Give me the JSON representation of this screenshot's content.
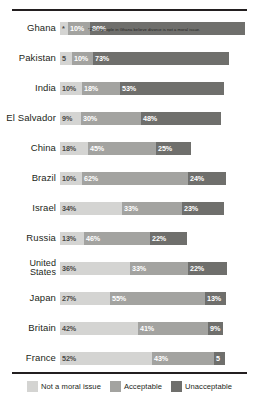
{
  "chart_data": {
    "type": "bar",
    "subtype": "stacked-horizontal",
    "title": "",
    "xlabel": "",
    "ylabel": "",
    "grid": false,
    "legend_position": "bottom",
    "categories": [
      "Ghana",
      "Pakistan",
      "India",
      "El Salvador",
      "China",
      "Brazil",
      "Israel",
      "Russia",
      "United States",
      "Japan",
      "Britain",
      "France"
    ],
    "series": [
      {
        "name": "Not a moral issue",
        "color": "#d4d4d2",
        "values": [
          2,
          5,
          10,
          9,
          18,
          10,
          34,
          13,
          36,
          27,
          42,
          52
        ]
      },
      {
        "name": "Acceptable",
        "color": "#a3a3a0",
        "values": [
          10,
          10,
          18,
          30,
          45,
          62,
          33,
          46,
          33,
          55,
          41,
          43
        ]
      },
      {
        "name": "Unacceptable",
        "color": "#6f6f6c",
        "values": [
          80,
          73,
          53,
          48,
          25,
          24,
          23,
          22,
          22,
          13,
          9,
          5
        ]
      }
    ],
    "rows": [
      {
        "label": "Ghana",
        "two_line": false,
        "bar_width": 185,
        "segments": [
          {
            "series": "Not a moral issue",
            "value": 2,
            "label": "*",
            "width": 8
          },
          {
            "series": "Acceptable",
            "value": 10,
            "label": "10%",
            "width": 22
          },
          {
            "series": "Unacceptable",
            "value": 80,
            "label": "80%",
            "width": 155
          }
        ]
      },
      {
        "label": "Pakistan",
        "two_line": false,
        "bar_width": 169,
        "segments": [
          {
            "series": "Not a moral issue",
            "value": 5,
            "label": "5",
            "width": 12
          },
          {
            "series": "Acceptable",
            "value": 10,
            "label": "10%",
            "width": 21
          },
          {
            "series": "Unacceptable",
            "value": 73,
            "label": "73%",
            "width": 136
          }
        ]
      },
      {
        "label": "India",
        "two_line": false,
        "bar_width": 164,
        "segments": [
          {
            "series": "Not a moral issue",
            "value": 10,
            "label": "10%",
            "width": 22
          },
          {
            "series": "Acceptable",
            "value": 18,
            "label": "18%",
            "width": 38
          },
          {
            "series": "Unacceptable",
            "value": 53,
            "label": "53%",
            "width": 104
          }
        ]
      },
      {
        "label": "El Salvador",
        "two_line": false,
        "bar_width": 161,
        "segments": [
          {
            "series": "Not a moral issue",
            "value": 9,
            "label": "9%",
            "width": 21
          },
          {
            "series": "Acceptable",
            "value": 30,
            "label": "30%",
            "width": 60
          },
          {
            "series": "Unacceptable",
            "value": 48,
            "label": "48%",
            "width": 80
          }
        ]
      },
      {
        "label": "China",
        "two_line": false,
        "bar_width": 131,
        "segments": [
          {
            "series": "Not a moral issue",
            "value": 18,
            "label": "18%",
            "width": 28
          },
          {
            "series": "Acceptable",
            "value": 45,
            "label": "45%",
            "width": 68
          },
          {
            "series": "Unacceptable",
            "value": 25,
            "label": "25%",
            "width": 35
          }
        ]
      },
      {
        "label": "Brazil",
        "two_line": false,
        "bar_width": 166,
        "segments": [
          {
            "series": "Not a moral issue",
            "value": 10,
            "label": "10%",
            "width": 22
          },
          {
            "series": "Acceptable",
            "value": 62,
            "label": "62%",
            "width": 106
          },
          {
            "series": "Unacceptable",
            "value": 24,
            "label": "24%",
            "width": 38
          }
        ]
      },
      {
        "label": "Israel",
        "two_line": false,
        "bar_width": 164,
        "segments": [
          {
            "series": "Not a moral issue",
            "value": 34,
            "label": "34%",
            "width": 62
          },
          {
            "series": "Acceptable",
            "value": 33,
            "label": "33%",
            "width": 60
          },
          {
            "series": "Unacceptable",
            "value": 23,
            "label": "23%",
            "width": 42
          }
        ]
      },
      {
        "label": "Russia",
        "two_line": false,
        "bar_width": 127,
        "segments": [
          {
            "series": "Not a moral issue",
            "value": 13,
            "label": "13%",
            "width": 24
          },
          {
            "series": "Acceptable",
            "value": 46,
            "label": "46%",
            "width": 66
          },
          {
            "series": "Unacceptable",
            "value": 22,
            "label": "22%",
            "width": 37
          }
        ]
      },
      {
        "label": "United States",
        "two_line": true,
        "bar_width": 167,
        "segments": [
          {
            "series": "Not a moral issue",
            "value": 36,
            "label": "36%",
            "width": 70
          },
          {
            "series": "Acceptable",
            "value": 33,
            "label": "33%",
            "width": 58
          },
          {
            "series": "Unacceptable",
            "value": 22,
            "label": "22%",
            "width": 39
          }
        ]
      },
      {
        "label": "Japan",
        "two_line": false,
        "bar_width": 166,
        "segments": [
          {
            "series": "Not a moral issue",
            "value": 27,
            "label": "27%",
            "width": 50
          },
          {
            "series": "Acceptable",
            "value": 55,
            "label": "55%",
            "width": 95
          },
          {
            "series": "Unacceptable",
            "value": 13,
            "label": "13%",
            "width": 21
          }
        ]
      },
      {
        "label": "Britain",
        "two_line": false,
        "bar_width": 163,
        "segments": [
          {
            "series": "Not a moral issue",
            "value": 42,
            "label": "42%",
            "width": 78
          },
          {
            "series": "Acceptable",
            "value": 41,
            "label": "41%",
            "width": 70
          },
          {
            "series": "Unacceptable",
            "value": 9,
            "label": "9%",
            "width": 15
          }
        ]
      },
      {
        "label": "France",
        "two_line": false,
        "bar_width": 165,
        "segments": [
          {
            "series": "Not a moral issue",
            "value": 52,
            "label": "52%",
            "width": 92
          },
          {
            "series": "Acceptable",
            "value": 43,
            "label": "43%",
            "width": 62
          },
          {
            "series": "Unacceptable",
            "value": 5,
            "label": "5",
            "width": 11
          }
        ]
      }
    ],
    "annotations": [
      {
        "text": "*2% of people in Ghana believe divorce is not a moral issue.",
        "attached_to": "Ghana"
      }
    ],
    "legend": [
      {
        "label": "Not a moral issue",
        "color": "#d4d4d2"
      },
      {
        "label": "Acceptable",
        "color": "#a3a3a0"
      },
      {
        "label": "Unacceptable",
        "color": "#6f6f6c"
      }
    ]
  }
}
